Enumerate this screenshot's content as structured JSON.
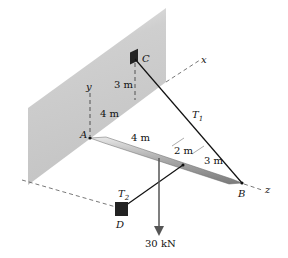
{
  "points": {
    "A": "A",
    "B": "B",
    "C": "C",
    "D": "D"
  },
  "axes": {
    "x": "x",
    "y": "y",
    "z": "z"
  },
  "tensions": {
    "T1": "T",
    "T1_sub": "1",
    "T2": "T",
    "T2_sub": "2"
  },
  "dimensions": {
    "C_height": "3 m",
    "C_offset_along_x": "4 m",
    "AB_segment_1": "4 m",
    "AB_segment_2": "2 m",
    "AB_segment_3": "3 m"
  },
  "load": {
    "label": "30 kN"
  },
  "colors": {
    "wall": "#c8c8c8",
    "rod": "#b8b8b8",
    "line": "#111111"
  }
}
